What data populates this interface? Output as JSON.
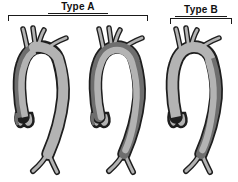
{
  "diagram": {
    "groups": [
      {
        "label": "Type A",
        "covers_figures": 2
      },
      {
        "label": "Type B",
        "covers_figures": 1
      }
    ],
    "figures": [
      {
        "name": "aorta-ascending-dissection-figure"
      },
      {
        "name": "aorta-ascending-and-descending-dissection-figure"
      },
      {
        "name": "aorta-descending-dissection-figure"
      }
    ],
    "colors": {
      "background": "#ffffff",
      "vessel_fill": "#b3b3b3",
      "dissection_fill": "#6e6e6e",
      "outline": "#1e1e1e",
      "text": "#111111"
    }
  }
}
